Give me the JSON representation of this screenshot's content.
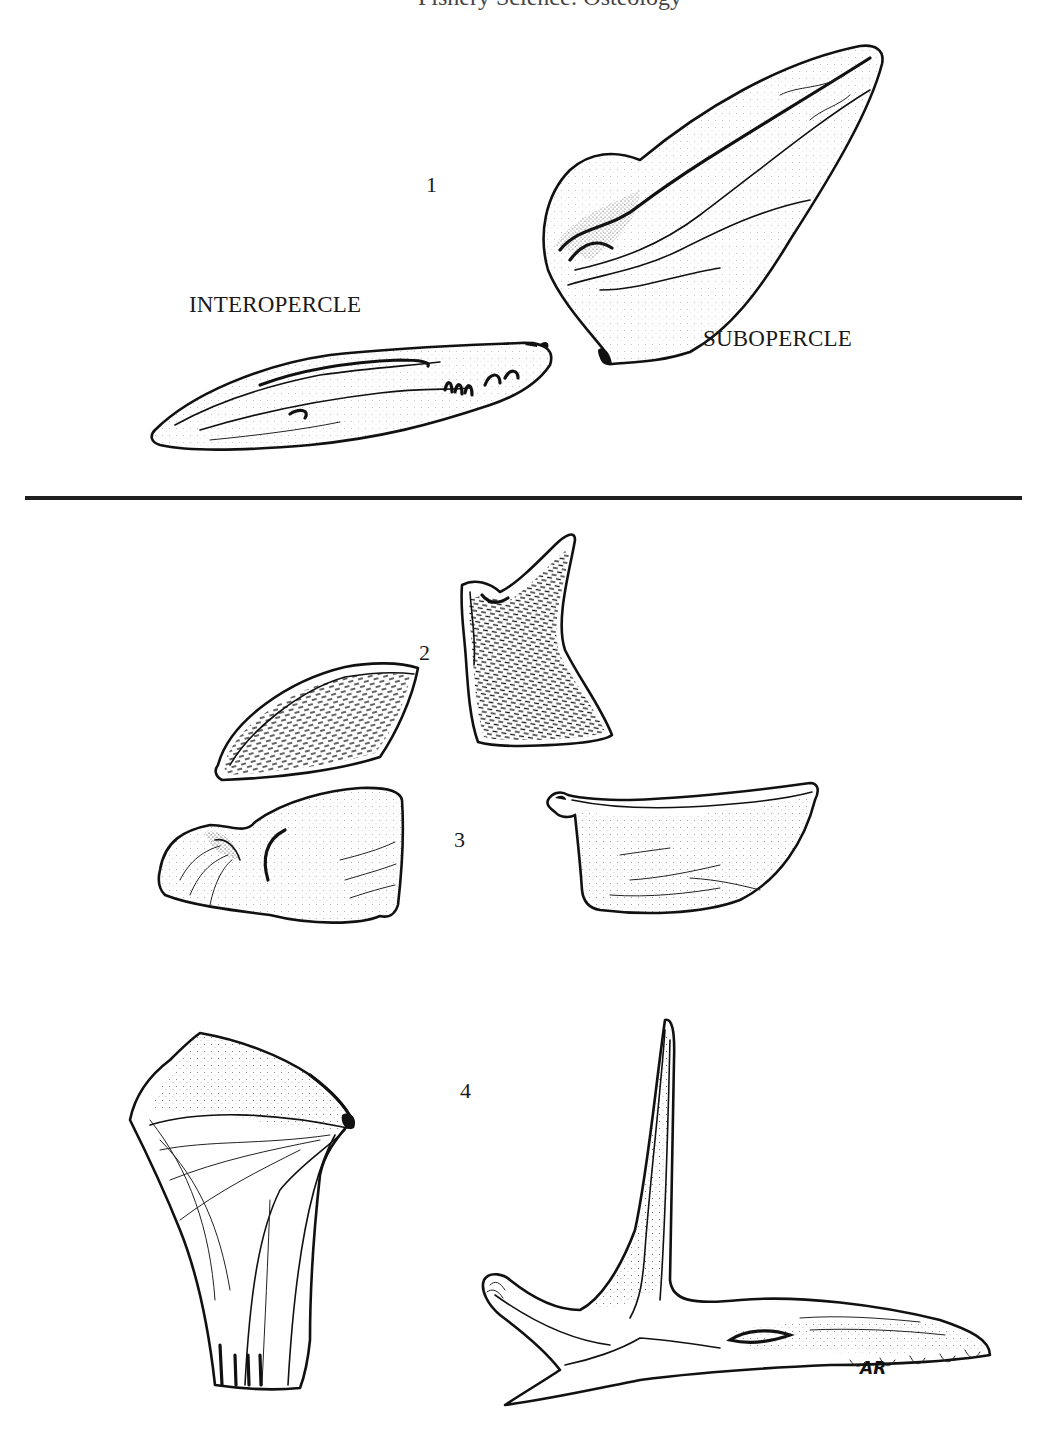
{
  "page": {
    "running_head": "Fishery Science: Osteology",
    "background": "#ffffff",
    "ink_color": "#1a1a1a"
  },
  "plate_top": {
    "figure_number": "1",
    "labels": {
      "interopercle": "INTEROPERCLE",
      "subopercle": "SUBOPERCLE"
    }
  },
  "plate_bottom": {
    "figures": [
      {
        "number": "2",
        "description": "Paired bones with dense striated surface"
      },
      {
        "number": "3",
        "description": "Paired stippled bones"
      },
      {
        "number": "4",
        "description": "Fan-shaped bone and spined bone"
      }
    ],
    "signature": "AR"
  }
}
